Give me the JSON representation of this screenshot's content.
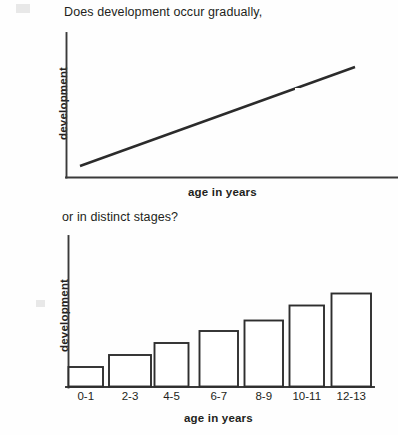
{
  "figure": {
    "background_color": "#fefefe",
    "ink_color": "#231f20"
  },
  "panels": [
    {
      "id": "gradual",
      "caption": "Does development occur gradually,",
      "ylabel": "development",
      "xlabel": "age in years"
    },
    {
      "id": "stages",
      "caption": "or in distinct stages?",
      "ylabel": "development",
      "xlabel": "age in years"
    }
  ],
  "chart_data": [
    {
      "type": "line",
      "title": "Does development occur gradually,",
      "xlabel": "age in years",
      "ylabel": "development",
      "grid": false,
      "legend": null,
      "xlim": [
        0,
        100
      ],
      "ylim": [
        0,
        100
      ],
      "x": [
        5,
        100
      ],
      "y": [
        8,
        76
      ],
      "series": [
        {
          "name": "development",
          "x": [
            5,
            100
          ],
          "y": [
            8,
            76
          ]
        }
      ],
      "annotations": [
        "straight continuous increasing line, no tick marks or numeric scale"
      ]
    },
    {
      "type": "bar",
      "title": "or in distinct stages?",
      "xlabel": "age in years",
      "ylabel": "development",
      "grid": false,
      "legend": null,
      "ylim": [
        0,
        100
      ],
      "categories": [
        "0-1",
        "2-3",
        "4-5",
        "6-7",
        "8-9",
        "10-11",
        "12-13"
      ],
      "values": [
        13,
        21,
        29,
        37,
        44,
        54,
        62
      ],
      "annotations": [
        "unfilled outlined bars increasing in steps, no numeric y scale"
      ]
    }
  ],
  "tick_labels": [
    "0-1",
    "2-3",
    "4-5",
    "6-7",
    "8-9",
    "10-11",
    "12-13"
  ]
}
